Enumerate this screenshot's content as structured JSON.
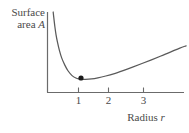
{
  "figure": {
    "background_color": "#ffffff",
    "line_color": "#5a5a5a",
    "axis_color": "#6b6b6b",
    "marker_color": "#1a1a1a",
    "text_color": "#4a4a4a"
  },
  "labels": {
    "y_axis_line1": "Surface",
    "y_axis_line2_prefix": "area ",
    "y_axis_line2_symbol": "A",
    "x_axis_prefix": "Radius ",
    "x_axis_symbol": "r"
  },
  "ticks": {
    "x": [
      {
        "label": "1",
        "px": 78
      },
      {
        "label": "2",
        "px": 108
      },
      {
        "label": "3",
        "px": 143
      }
    ]
  },
  "chart_data": {
    "type": "line",
    "title": "",
    "xlabel": "Radius r",
    "ylabel": "Surface area A",
    "xlim": [
      0,
      4.3
    ],
    "ylim": [
      0,
      1
    ],
    "grid": false,
    "legend": null,
    "xticks": [
      1,
      2,
      3
    ],
    "yticks": [],
    "series": [
      {
        "name": "Surface area A(r)",
        "style": "solid",
        "color": "#5a5a5a",
        "x": [
          0.18,
          0.2,
          0.23,
          0.27,
          0.32,
          0.38,
          0.45,
          0.55,
          0.65,
          0.78,
          0.9,
          1.0,
          1.1,
          1.2,
          1.4,
          1.6,
          1.85,
          2.1,
          2.4,
          2.7,
          3.0,
          3.3,
          3.6,
          3.9,
          4.2,
          4.4
        ],
        "y": [
          1.0,
          0.93,
          0.83,
          0.72,
          0.62,
          0.52,
          0.43,
          0.34,
          0.27,
          0.21,
          0.18,
          0.168,
          0.163,
          0.162,
          0.168,
          0.182,
          0.205,
          0.232,
          0.272,
          0.315,
          0.36,
          0.406,
          0.453,
          0.502,
          0.552,
          0.58
        ]
      }
    ],
    "markers": [
      {
        "name": "minimum-point",
        "x": 1.15,
        "y": 0.162,
        "px": 81,
        "py": 78,
        "radius": 2.6,
        "color": "#1a1a1a"
      }
    ],
    "annotations": []
  }
}
